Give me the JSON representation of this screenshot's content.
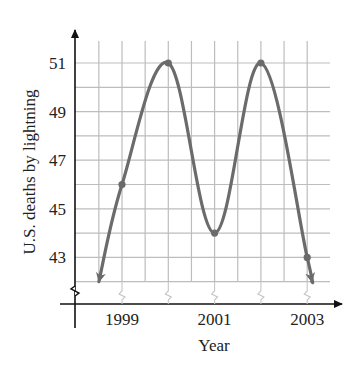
{
  "chart_data": {
    "type": "line",
    "title": "",
    "xlabel": "Year",
    "ylabel": "U.S. deaths by lightning",
    "x_ticks": [
      "1999",
      "2001",
      "2003"
    ],
    "y_ticks": [
      "43",
      "45",
      "47",
      "49",
      "51"
    ],
    "xlim": [
      1998.5,
      2003.5
    ],
    "ylim": [
      42,
      52
    ],
    "grid": true,
    "grid_minor_x_step": 0.5,
    "grid_y_step": 1,
    "axis_breaks": true,
    "series": [
      {
        "name": "U.S. deaths by lightning",
        "color": "#6b6b6b",
        "points": [
          {
            "x": 1999,
            "y": 46
          },
          {
            "x": 2000,
            "y": 51
          },
          {
            "x": 2001,
            "y": 44
          },
          {
            "x": 2002,
            "y": 51
          },
          {
            "x": 2003,
            "y": 43
          }
        ],
        "curve_endpoints": {
          "start": {
            "x": 1998.5,
            "y": 42
          },
          "end": {
            "x": 2003.1,
            "y": 42
          }
        },
        "endpoint_arrows": true,
        "marked_points": [
          {
            "x": 1999,
            "y": 46
          },
          {
            "x": 2000,
            "y": 51
          },
          {
            "x": 2001,
            "y": 44
          },
          {
            "x": 2002,
            "y": 51
          },
          {
            "x": 2003,
            "y": 43
          }
        ]
      }
    ],
    "legend": null
  }
}
